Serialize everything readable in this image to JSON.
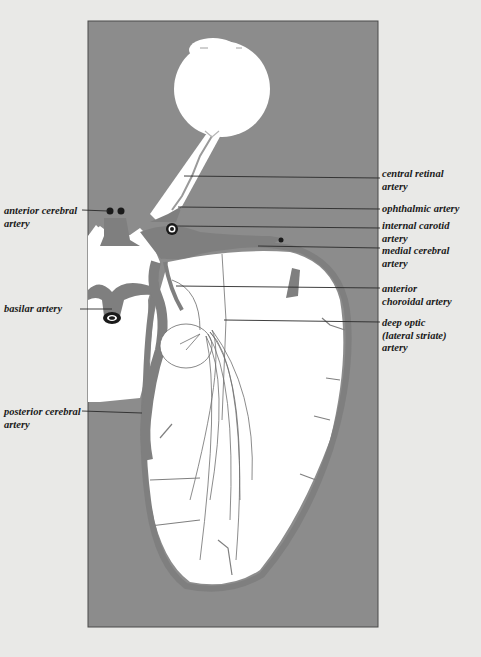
{
  "diagram": {
    "type": "anatomical illustration",
    "colors": {
      "background": "#e9e9e7",
      "panel": "#8c8c8c",
      "tissue": "#ffffff",
      "vessel": "#7f7f7f",
      "leader_line": "#2a2a2a"
    },
    "labels_right": [
      {
        "id": "central-retinal-artery",
        "text": "central retinal\nartery"
      },
      {
        "id": "ophthalmic-artery",
        "text": "ophthalmic artery"
      },
      {
        "id": "internal-carotid-artery",
        "text": "internal carotid\nartery"
      },
      {
        "id": "medial-cerebral-artery",
        "text": "medial cerebral\nartery"
      },
      {
        "id": "anterior-choroidal-artery",
        "text": "anterior\nchoroidal artery"
      },
      {
        "id": "deep-optic-artery",
        "text": "deep optic\n(lateral striate)\nartery"
      }
    ],
    "labels_left": [
      {
        "id": "anterior-cerebral-artery",
        "text": "anterior cerebral\nartery"
      },
      {
        "id": "basilar-artery",
        "text": "basilar artery"
      },
      {
        "id": "posterior-cerebral-artery",
        "text": "posterior cerebral\nartery"
      }
    ]
  }
}
